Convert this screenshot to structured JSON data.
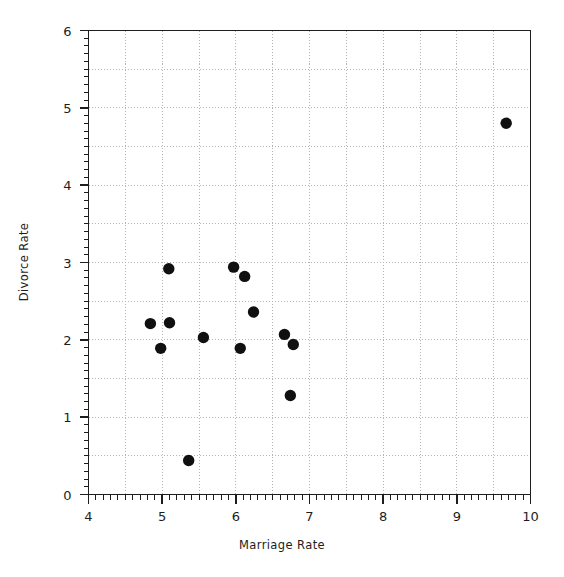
{
  "chart_data": {
    "type": "scatter",
    "title": "",
    "xlabel": "Marriage Rate",
    "ylabel": "Divorce Rate",
    "xlim": [
      4,
      10
    ],
    "ylim": [
      0,
      6
    ],
    "x_ticks": [
      4,
      5,
      6,
      7,
      8,
      9,
      10
    ],
    "y_ticks": [
      0,
      1,
      2,
      3,
      4,
      5,
      6
    ],
    "x_tick_labels": [
      "4",
      "5",
      "6",
      "7",
      "8",
      "9",
      "10"
    ],
    "y_tick_labels": [
      "0",
      "1",
      "2",
      "3",
      "4",
      "5",
      "6"
    ],
    "grid": true,
    "grid_step_x": 0.5,
    "grid_step_y": 0.5,
    "minor_tick_step_x": 0.1,
    "minor_tick_step_y": 0.1,
    "legend": null,
    "marker": "filled-circle",
    "marker_color": "#101010",
    "marker_size": 7,
    "points": [
      {
        "x": 4.84,
        "y": 2.21
      },
      {
        "x": 4.98,
        "y": 1.89
      },
      {
        "x": 5.09,
        "y": 2.92
      },
      {
        "x": 5.1,
        "y": 2.22
      },
      {
        "x": 5.36,
        "y": 0.44
      },
      {
        "x": 5.56,
        "y": 2.03
      },
      {
        "x": 5.97,
        "y": 2.94
      },
      {
        "x": 6.06,
        "y": 1.89
      },
      {
        "x": 6.12,
        "y": 2.82
      },
      {
        "x": 6.24,
        "y": 2.36
      },
      {
        "x": 6.66,
        "y": 2.07
      },
      {
        "x": 6.74,
        "y": 1.28
      },
      {
        "x": 6.78,
        "y": 1.94
      },
      {
        "x": 9.67,
        "y": 4.8
      }
    ]
  },
  "style": {
    "axis_color": "#1d1d1d",
    "grid_color": "#b4b4b4",
    "background": "#ffffff"
  }
}
